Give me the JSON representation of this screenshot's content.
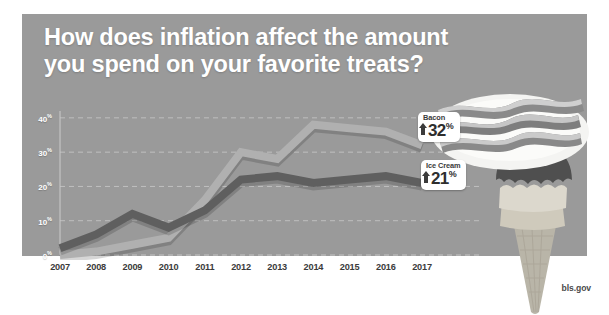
{
  "headline": {
    "line1": "How does inflation affect the amount",
    "line2": "you spend on your favorite treats?"
  },
  "attribution": "bls.gov",
  "colors": {
    "panel_background": "#9a9a9a",
    "page_background": "#ffffff",
    "headline_text": "#ffffff",
    "bacon_line": "#b0b0b0",
    "icecream_line": "#5f5f5f",
    "gridline": "#c9c9c9",
    "axis_text": "#3b3b3b",
    "callout_background": "#ffffff",
    "callout_text": "#2e2e2e"
  },
  "callouts": [
    {
      "id": "bacon",
      "title": "Bacon",
      "arrow": "arrow-up-icon",
      "value": "32",
      "unit": "%"
    },
    {
      "id": "icecream",
      "title": "Ice Cream",
      "arrow": "arrow-up-icon",
      "value": "21",
      "unit": "%"
    }
  ],
  "chart_data": {
    "type": "line",
    "title": "How does inflation affect the amount you spend on your favorite treats?",
    "xlabel": "",
    "ylabel": "",
    "x": [
      2007,
      2008,
      2009,
      2010,
      2011,
      2012,
      2013,
      2014,
      2015,
      2016,
      2017
    ],
    "categories": [
      "2007",
      "2008",
      "2009",
      "2010",
      "2011",
      "2012",
      "2013",
      "2014",
      "2015",
      "2016",
      "2017"
    ],
    "ytick_labels": [
      "0%",
      "10%",
      "20%",
      "30%",
      "40%"
    ],
    "ytick_values": [
      0,
      10,
      20,
      30,
      40
    ],
    "ylim": [
      0,
      42
    ],
    "grid": true,
    "legend": "callout-labels",
    "series": [
      {
        "name": "Bacon",
        "color": "#b0b0b0",
        "values": [
          0,
          1,
          3,
          5,
          16,
          30,
          28,
          38,
          37,
          36,
          32
        ]
      },
      {
        "name": "Ice Cream",
        "color": "#5f5f5f",
        "values": [
          2,
          6,
          12,
          8,
          13,
          22,
          23,
          21,
          22,
          23,
          21
        ]
      }
    ]
  }
}
